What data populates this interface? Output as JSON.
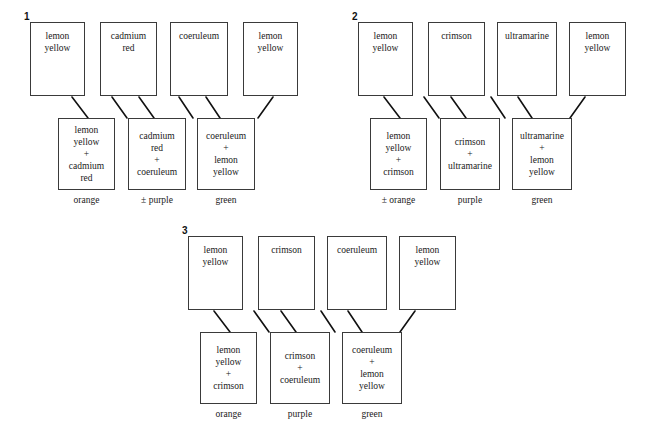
{
  "diagrams": [
    {
      "number": "1",
      "pigments": [
        {
          "label": "lemon\nyellow"
        },
        {
          "label": "cadmium\nred"
        },
        {
          "label": "coeruleum"
        },
        {
          "label": "lemon\nyellow"
        }
      ],
      "mixtures": [
        {
          "label": "lemon\nyellow\n+\ncadmium\nred",
          "result": "orange"
        },
        {
          "label": "cadmium\nred\n+\ncoeruleum",
          "result": "± purple"
        },
        {
          "label": "coeruleum\n+\nlemon\nyellow",
          "result": "green"
        }
      ]
    },
    {
      "number": "2",
      "pigments": [
        {
          "label": "lemon\nyellow"
        },
        {
          "label": "crimson"
        },
        {
          "label": "ultramarine"
        },
        {
          "label": "lemon\nyellow"
        }
      ],
      "mixtures": [
        {
          "label": "lemon\nyellow\n+\ncrimson",
          "result": "± orange"
        },
        {
          "label": "crimson\n+\nultramarine",
          "result": "purple"
        },
        {
          "label": "ultramarine\n+\nlemon\nyellow",
          "result": "green"
        }
      ]
    },
    {
      "number": "3",
      "pigments": [
        {
          "label": "lemon\nyellow"
        },
        {
          "label": "crimson"
        },
        {
          "label": "coeruleum"
        },
        {
          "label": "lemon\nyellow"
        }
      ],
      "mixtures": [
        {
          "label": "lemon\nyellow\n+\ncrimson",
          "result": "orange"
        },
        {
          "label": "crimson\n+\ncoeruleum",
          "result": "purple"
        },
        {
          "label": "coeruleum\n+\nlemon\nyellow",
          "result": "green"
        }
      ]
    }
  ],
  "colors": {
    "stroke": "#3a3a3a",
    "line": "#111111",
    "text": "#1a1a1a",
    "background": "#ffffff"
  }
}
